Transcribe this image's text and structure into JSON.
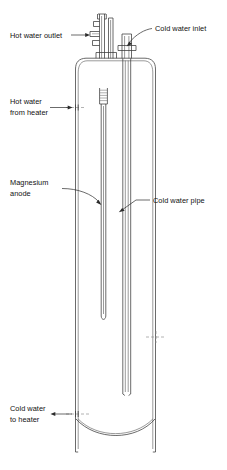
{
  "figure": {
    "background_color": "#ffffff",
    "line_color": "#3a3a3a",
    "text_color": "#111111"
  },
  "labels": {
    "hot_water_outlet": {
      "line1": "Hot water outlet",
      "name": "hot-water-outlet"
    },
    "cold_water_inlet": {
      "line1": "Cold water inlet",
      "name": "cold-water-inlet"
    },
    "hot_water_from_heater": {
      "line1": "Hot water",
      "line2": "from heater",
      "name": "hot-water-from-heater"
    },
    "magnesium_anode": {
      "line1": "Magnesium",
      "line2": "anode",
      "name": "magnesium-anode"
    },
    "cold_water_pipe": {
      "line1": "Cold water pipe",
      "name": "cold-water-pipe"
    },
    "cold_water_to_heater": {
      "line1": "Cold water",
      "line2": "to heater",
      "name": "cold-water-to-heater"
    }
  },
  "components": {
    "tank_shell": "tank-shell",
    "tank_dome_top": "tank-dome-top",
    "tank_dome_bottom": "tank-dome-bottom",
    "outlet_nipple": "outlet-nipple",
    "inlet_nipple": "inlet-nipple",
    "anode_rod": "anode-rod",
    "anode_collar": "anode-collar",
    "dip_tube": "dip-tube",
    "hot_port": "hot-port",
    "cold_port": "cold-port"
  }
}
